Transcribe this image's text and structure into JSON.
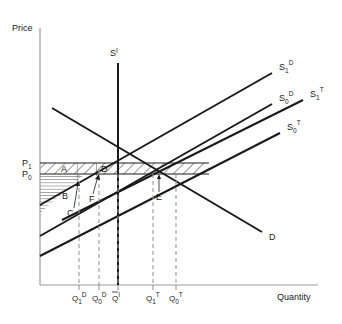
{
  "figure": {
    "width": 342,
    "height": 324,
    "background": "#ffffff",
    "line_color": "#1a1a1a",
    "axis_color": "#999999",
    "dash_color": "#999999"
  },
  "axes": {
    "y_label": "Price",
    "x_label": "Quantity",
    "origin_x": 40,
    "origin_y": 285,
    "top_y": 28,
    "right_x": 318
  },
  "price_levels": [
    {
      "id": "P1",
      "label": "P",
      "subscript": "1",
      "y": 163,
      "value_rank": 1
    },
    {
      "id": "P0",
      "label": "P",
      "subscript": "0",
      "y": 174,
      "value_rank": 0
    }
  ],
  "quantity_ticks": [
    {
      "id": "Q1D",
      "base": "Q",
      "subscript": "1",
      "superscript": "D",
      "x": 79,
      "overbar": false
    },
    {
      "id": "Q0D",
      "base": "Q",
      "subscript": "0",
      "superscript": "D",
      "x": 99,
      "overbar": false
    },
    {
      "id": "QbarI",
      "base": "Q",
      "subscript": "",
      "superscript": "I",
      "x": 118,
      "overbar": true
    },
    {
      "id": "Q1T",
      "base": "Q",
      "subscript": "1",
      "superscript": "T",
      "x": 153,
      "overbar": false
    },
    {
      "id": "Q0T",
      "base": "Q",
      "subscript": "0",
      "superscript": "T",
      "x": 176,
      "overbar": false
    }
  ],
  "curves": [
    {
      "id": "SI",
      "base": "S",
      "subscript": "",
      "superscript": "I",
      "type": "vertical-supply",
      "label_x": 112,
      "label_y": 56,
      "x1": 118,
      "y1": 63,
      "x2": 118,
      "y2": 285
    },
    {
      "id": "S1D",
      "base": "S",
      "subscript": "1",
      "superscript": "D",
      "type": "supply",
      "label_x": 281,
      "label_y": 67,
      "x1": 40,
      "y1": 205,
      "x2": 272,
      "y2": 73
    },
    {
      "id": "S0D",
      "base": "S",
      "subscript": "0",
      "superscript": "D",
      "type": "supply",
      "label_x": 281,
      "label_y": 98,
      "x1": 40,
      "y1": 236,
      "x2": 272,
      "y2": 104
    },
    {
      "id": "S1T",
      "base": "S",
      "subscript": "1",
      "superscript": "T",
      "type": "supply",
      "label_x": 312,
      "label_y": 94,
      "x1": 62,
      "y1": 220,
      "x2": 303,
      "y2": 100
    },
    {
      "id": "S0T",
      "base": "S",
      "subscript": "0",
      "superscript": "T",
      "type": "supply",
      "label_x": 289,
      "label_y": 127,
      "x1": 40,
      "y1": 256,
      "x2": 280,
      "y2": 133
    },
    {
      "id": "D",
      "base": "D",
      "subscript": "",
      "superscript": "",
      "type": "demand",
      "label_x": 272,
      "label_y": 237,
      "x1": 52,
      "y1": 108,
      "x2": 262,
      "y2": 232
    }
  ],
  "regions": [
    {
      "id": "A",
      "label": "A",
      "label_x": 64,
      "label_y": 170,
      "hatch": "diagonal"
    },
    {
      "id": "B",
      "label": "B",
      "label_x": 65,
      "label_y": 196,
      "hatch": "horizontal"
    },
    {
      "id": "C",
      "label": "C",
      "label_x": 70,
      "label_y": 214,
      "hatch": "vertical",
      "leader": true
    },
    {
      "id": "D",
      "label": "D",
      "label_x": 104,
      "label_y": 170,
      "hatch": "diagonal"
    },
    {
      "id": "E",
      "label": "E",
      "label_x": 159,
      "label_y": 197,
      "hatch": "none",
      "leader": true
    },
    {
      "id": "F",
      "label": "F",
      "label_x": 92,
      "label_y": 199,
      "hatch": "none",
      "leader": true
    }
  ]
}
